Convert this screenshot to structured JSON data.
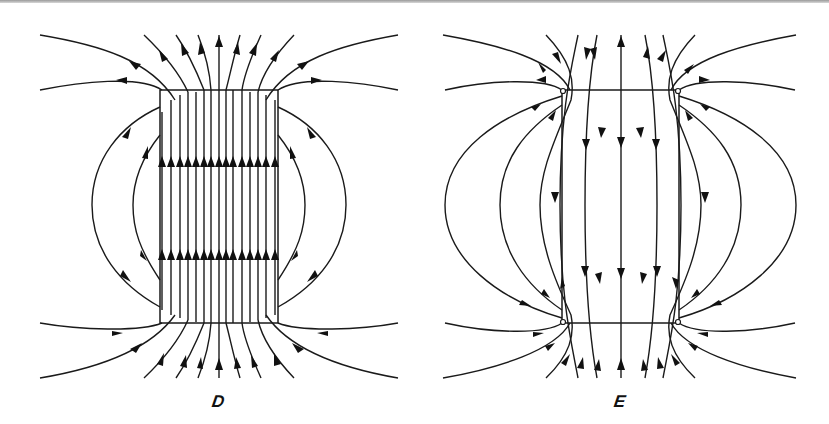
{
  "figure": {
    "panels": [
      {
        "id": "D",
        "label": "D",
        "description": "Displacement field lines of a uniformly polarized cylinder; lines continuous, pointing upward inside"
      },
      {
        "id": "E",
        "label": "E",
        "description": "Electric field lines of a uniformly polarized cylinder; lines start/end on bound surface charges, pointing downward inside"
      }
    ]
  },
  "colors": {
    "line": "#1a1a1a",
    "background": "#ffffff",
    "border": "#9a9a9a"
  }
}
